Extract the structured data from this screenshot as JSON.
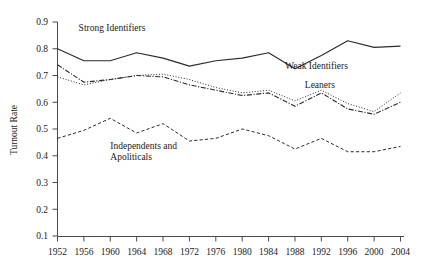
{
  "chart_data": {
    "type": "line",
    "title": "",
    "xlabel": "",
    "ylabel": "Turnout Rate",
    "ylim": [
      0.1,
      0.9
    ],
    "ytick_labels": [
      "0.9",
      "0.8",
      "0.7",
      "0.6",
      "0.5",
      "0.4",
      "0.3",
      "0.2",
      "0.1"
    ],
    "ytick_values": [
      0.9,
      0.8,
      0.7,
      0.6,
      0.5,
      0.4,
      0.3,
      0.2,
      0.1
    ],
    "grid": false,
    "legend_position": "inline-annotations",
    "categories": [
      1952,
      1956,
      1960,
      1964,
      1968,
      1972,
      1976,
      1980,
      1984,
      1988,
      1992,
      1996,
      2000,
      2004
    ],
    "xtick_labels": [
      "1952",
      "1956",
      "1960",
      "1964",
      "1968",
      "1972",
      "1976",
      "1980",
      "1984",
      "1988",
      "1992",
      "1996",
      "2000",
      "2004"
    ],
    "series": [
      {
        "name": "Strong Identifiers",
        "line_style": "solid",
        "values": [
          0.8,
          0.755,
          0.755,
          0.785,
          0.765,
          0.735,
          0.755,
          0.765,
          0.785,
          0.725,
          0.775,
          0.83,
          0.805,
          0.81
        ]
      },
      {
        "name": "Weak Identifiers",
        "line_style": "dotted",
        "values": [
          0.695,
          0.665,
          0.685,
          0.7,
          0.705,
          0.685,
          0.655,
          0.635,
          0.645,
          0.605,
          0.645,
          0.595,
          0.565,
          0.635
        ]
      },
      {
        "name": "Leaners",
        "line_style": "dash-dot",
        "values": [
          0.74,
          0.675,
          0.685,
          0.7,
          0.695,
          0.665,
          0.645,
          0.625,
          0.635,
          0.585,
          0.635,
          0.575,
          0.555,
          0.6
        ]
      },
      {
        "name": "Independents and Apoliticals",
        "line_style": "dashed",
        "values": [
          0.465,
          0.495,
          0.54,
          0.485,
          0.52,
          0.455,
          0.465,
          0.5,
          0.475,
          0.425,
          0.465,
          0.415,
          0.415,
          0.435
        ]
      }
    ],
    "annotations": [
      {
        "text": "Strong Identifiers",
        "x": 1955.2,
        "y": 0.865
      },
      {
        "text": "Weak Identifiers",
        "x": 1986.5,
        "y": 0.725
      },
      {
        "text": "Leaners",
        "x": 1989.5,
        "y": 0.655
      },
      {
        "text": "Independents and",
        "x": 1960.0,
        "y": 0.425
      },
      {
        "text": "Apoliticals",
        "x": 1960.0,
        "y": 0.385
      }
    ]
  }
}
